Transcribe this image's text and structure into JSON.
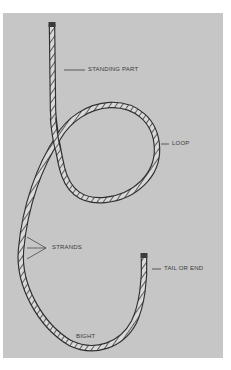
{
  "diagram": {
    "labels": {
      "standing_part": "STANDING PART",
      "loop": "LOOP",
      "strands": "STRANDS",
      "tail": "TAIL OR END",
      "bight": "BIGHT"
    },
    "colors": {
      "panel": "#c6c6c6",
      "background": "#ffffff",
      "rope_outline": "#2e2e2e",
      "rope_fill": "#d8d8d8",
      "label_text": "#3a3a3a"
    }
  }
}
